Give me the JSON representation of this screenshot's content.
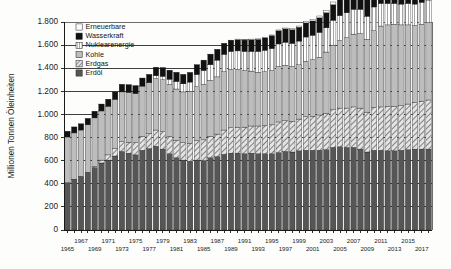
{
  "chart_data": {
    "type": "bar",
    "stacked": true,
    "title": "",
    "subtitle": "",
    "xlabel": "",
    "ylabel": "Millionen Tonnen Öleinheiten",
    "ylim": [
      0,
      1800
    ],
    "ytick_step": 200,
    "ytick_labels": [
      "0",
      "200",
      "400",
      "600",
      "800",
      "1.000",
      "1.200",
      "1.400",
      "1.600",
      "1.800"
    ],
    "ytick_values": [
      0,
      200,
      400,
      600,
      800,
      1000,
      1200,
      1400,
      1600,
      1800
    ],
    "grid": "horizontal-major-only",
    "legend_position": "top-left-inside",
    "categories": [
      "1965",
      "1966",
      "1967",
      "1968",
      "1969",
      "1970",
      "1971",
      "1972",
      "1973",
      "1974",
      "1975",
      "1976",
      "1977",
      "1978",
      "1979",
      "1980",
      "1981",
      "1982",
      "1983",
      "1984",
      "1985",
      "1986",
      "1987",
      "1988",
      "1989",
      "1990",
      "1991",
      "1992",
      "1993",
      "1994",
      "1995",
      "1996",
      "1997",
      "1998",
      "1999",
      "2000",
      "2001",
      "2002",
      "2003",
      "2004",
      "2005",
      "2006",
      "2007",
      "2008",
      "2009",
      "2010",
      "2011",
      "2012",
      "2013",
      "2014",
      "2015",
      "2016",
      "2017",
      "2018"
    ],
    "xtick_labels_row1": [
      "1965",
      "1967",
      "1969",
      "1971",
      "1973",
      "1975",
      "1977",
      "1979",
      "1981",
      "1983",
      "1985",
      "1987",
      "1989",
      "1991",
      "1993",
      "1995",
      "1997",
      "1999",
      "2001",
      "2003",
      "2005",
      "2007",
      "2009",
      "2011",
      "2013",
      "2015",
      "2017"
    ],
    "series": [
      {
        "name": "Erdöl",
        "swatch": "#565656",
        "pattern": "solid",
        "values": [
          410,
          440,
          465,
          500,
          540,
          580,
          605,
          640,
          680,
          665,
          650,
          690,
          705,
          725,
          700,
          660,
          625,
          605,
          595,
          605,
          600,
          625,
          635,
          655,
          665,
          665,
          660,
          665,
          660,
          660,
          660,
          670,
          680,
          675,
          685,
          690,
          690,
          690,
          695,
          715,
          720,
          715,
          715,
          700,
          675,
          690,
          690,
          685,
          685,
          690,
          695,
          700,
          700,
          700
        ]
      },
      {
        "name": "Erdgas",
        "swatch": "#d8d8d8",
        "pattern": "diagonal-hatch",
        "values": [
          0,
          0,
          0,
          0,
          10,
          25,
          45,
          65,
          85,
          95,
          105,
          120,
          130,
          140,
          150,
          150,
          150,
          150,
          155,
          170,
          180,
          185,
          195,
          210,
          220,
          225,
          230,
          235,
          240,
          245,
          250,
          265,
          265,
          265,
          275,
          290,
          295,
          305,
          315,
          325,
          335,
          340,
          350,
          355,
          345,
          370,
          375,
          385,
          385,
          385,
          395,
          405,
          415,
          425
        ]
      },
      {
        "name": "Kohle",
        "swatch": "#bdbdbd",
        "pattern": "solid",
        "values": [
          395,
          400,
          400,
          410,
          420,
          425,
          420,
          425,
          430,
          430,
          425,
          435,
          440,
          445,
          450,
          450,
          445,
          440,
          450,
          465,
          480,
          485,
          495,
          505,
          505,
          500,
          490,
          475,
          465,
          465,
          470,
          480,
          480,
          475,
          470,
          480,
          490,
          500,
          530,
          560,
          585,
          610,
          630,
          645,
          630,
          665,
          700,
          705,
          710,
          700,
          685,
          665,
          665,
          670
        ]
      },
      {
        "name": "Nuklearenergie",
        "swatch": "#ffffff",
        "pattern": "vertical-stripes",
        "values": [
          0,
          0,
          0,
          0,
          0,
          0,
          0,
          0,
          0,
          0,
          0,
          0,
          0,
          25,
          30,
          45,
          65,
          70,
          80,
          105,
          120,
          135,
          145,
          150,
          155,
          160,
          165,
          170,
          180,
          185,
          190,
          195,
          200,
          200,
          205,
          210,
          210,
          215,
          210,
          215,
          215,
          215,
          215,
          210,
          200,
          205,
          195,
          185,
          180,
          180,
          185,
          185,
          190,
          195
        ]
      },
      {
        "name": "Wasserkraft",
        "swatch": "#111111",
        "pattern": "solid",
        "values": [
          50,
          52,
          54,
          56,
          58,
          60,
          62,
          64,
          66,
          68,
          70,
          70,
          72,
          74,
          76,
          78,
          80,
          82,
          84,
          86,
          90,
          92,
          94,
          96,
          98,
          100,
          102,
          104,
          106,
          110,
          113,
          115,
          116,
          118,
          120,
          122,
          124,
          126,
          130,
          135,
          140,
          145,
          150,
          155,
          158,
          165,
          168,
          172,
          178,
          182,
          185,
          190,
          196,
          200
        ]
      },
      {
        "name": "Erneuerbare",
        "swatch": "#ffffff",
        "pattern": "solid",
        "values": [
          0,
          0,
          0,
          0,
          0,
          0,
          0,
          0,
          0,
          0,
          0,
          0,
          0,
          0,
          0,
          0,
          0,
          0,
          0,
          0,
          0,
          0,
          0,
          0,
          0,
          2,
          2,
          3,
          3,
          4,
          5,
          6,
          7,
          8,
          10,
          12,
          14,
          16,
          19,
          23,
          28,
          33,
          40,
          48,
          55,
          66,
          78,
          88,
          100,
          114,
          130,
          146,
          164,
          186
        ]
      }
    ],
    "legend_entries": [
      {
        "label": "Erneuerbare",
        "swatch": "#ffffff",
        "pattern": "solid"
      },
      {
        "label": "Wasserkraft",
        "swatch": "#111111",
        "pattern": "solid"
      },
      {
        "label": "Nuklearenergie",
        "swatch": "#ffffff",
        "pattern": "vertical-stripes"
      },
      {
        "label": "Kohle",
        "swatch": "#bdbdbd",
        "pattern": "solid"
      },
      {
        "label": "Erdgas",
        "swatch": "#d8d8d8",
        "pattern": "diagonal-hatch"
      },
      {
        "label": "Erdöl",
        "swatch": "#565656",
        "pattern": "solid"
      }
    ]
  }
}
